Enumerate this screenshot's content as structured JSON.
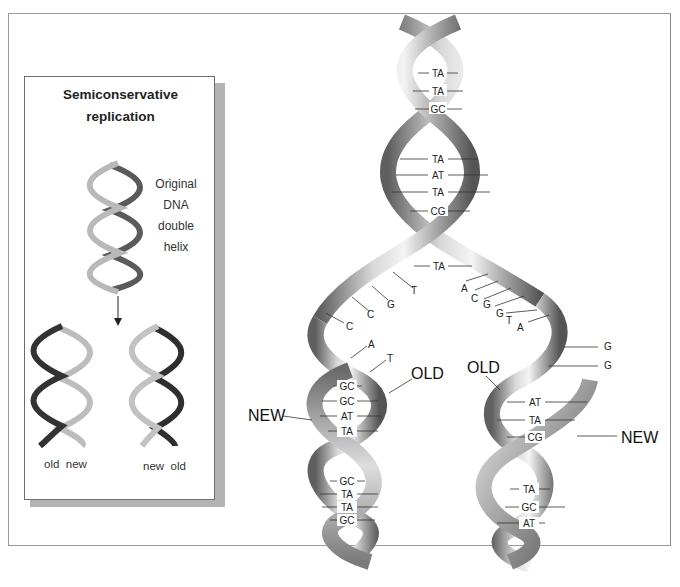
{
  "inset": {
    "title_line1": "Semiconservative",
    "title_line2": "replication",
    "original_label": [
      "Original",
      "DNA",
      "double",
      "helix"
    ],
    "left_daughter_label": "old  new",
    "right_daughter_label": "new  old"
  },
  "main": {
    "parent_pairs": [
      "TA",
      "TA",
      "GC",
      "TA",
      "AT",
      "TA",
      "CG",
      "TA"
    ],
    "left_fork_bases": [
      "T",
      "G",
      "C",
      "C",
      "A",
      "T"
    ],
    "right_fork_bases": [
      "A",
      "C",
      "G",
      "G",
      "T",
      "A"
    ],
    "right_far_bases": [
      "G",
      "G"
    ],
    "left_daughter_pairs": [
      "GC",
      "GC",
      "AT",
      "TA"
    ],
    "left_daughter_lower_pairs": [
      "GC",
      "TA",
      "TA",
      "GC"
    ],
    "right_daughter_pairs": [
      "AT",
      "TA",
      "CG"
    ],
    "right_daughter_lower_pairs": [
      "TA",
      "GC",
      "AT"
    ],
    "labels": {
      "old_left": "OLD",
      "old_right": "OLD",
      "new_left": "NEW",
      "new_right": "NEW"
    }
  },
  "colors": {
    "ribbon_light": "#e8e8e8",
    "ribbon_mid": "#a9a9a9",
    "ribbon_dark": "#5f5f5f",
    "strand_old": "#b8b8b8",
    "strand_new": "#3a3a3a",
    "frame": "#9a9a9a"
  }
}
